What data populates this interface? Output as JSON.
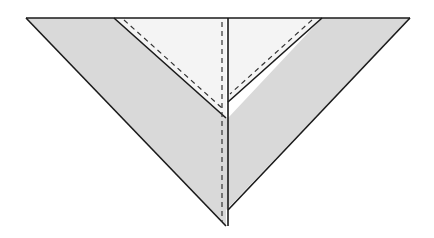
{
  "diagram": {
    "type": "origami-fold-step",
    "colors": {
      "background": "#ffffff",
      "outer_paper": "#d9d9d9",
      "inner_paper": "#f4f4f4",
      "stroke": "#1a1a1a",
      "dashed": "#333333"
    }
  }
}
